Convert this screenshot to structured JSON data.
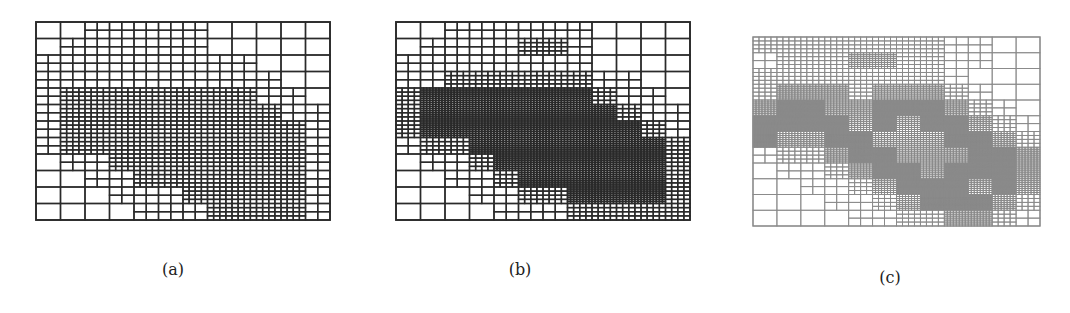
{
  "figure": {
    "type": "adaptive-mesh-refinement",
    "panels": [
      {
        "id": "a",
        "caption": "(a)",
        "stroke": "#2a2a2a",
        "coarse_cols": 12,
        "coarse_rows": 12,
        "levels": [
          [
            0,
            0,
            1,
            1,
            1,
            1,
            1,
            0,
            0,
            0,
            0,
            0
          ],
          [
            0,
            1,
            1,
            1,
            1,
            1,
            1,
            0,
            0,
            0,
            0,
            0
          ],
          [
            1,
            1,
            1,
            1,
            1,
            1,
            1,
            1,
            1,
            0,
            0,
            0
          ],
          [
            1,
            1,
            1,
            1,
            1,
            1,
            1,
            1,
            1,
            1,
            0,
            0
          ],
          [
            1,
            2,
            2,
            2,
            2,
            2,
            2,
            2,
            2,
            1,
            1,
            0
          ],
          [
            1,
            2,
            2,
            2,
            2,
            2,
            2,
            2,
            2,
            2,
            1,
            1
          ],
          [
            1,
            2,
            2,
            2,
            2,
            2,
            2,
            2,
            2,
            2,
            2,
            1
          ],
          [
            1,
            2,
            2,
            2,
            2,
            2,
            2,
            2,
            2,
            2,
            2,
            1
          ],
          [
            0,
            1,
            1,
            2,
            2,
            2,
            2,
            2,
            2,
            2,
            2,
            1
          ],
          [
            0,
            0,
            1,
            1,
            2,
            2,
            2,
            2,
            2,
            2,
            2,
            1
          ],
          [
            0,
            0,
            0,
            1,
            1,
            1,
            2,
            2,
            2,
            2,
            2,
            1
          ],
          [
            0,
            0,
            0,
            0,
            1,
            1,
            1,
            2,
            2,
            2,
            2,
            1
          ]
        ]
      },
      {
        "id": "b",
        "caption": "(b)",
        "stroke": "#2a2a2a",
        "coarse_cols": 12,
        "coarse_rows": 12,
        "levels": [
          [
            0,
            0,
            1,
            1,
            1,
            1,
            1,
            1,
            0,
            0,
            0,
            0
          ],
          [
            0,
            1,
            1,
            1,
            1,
            2,
            2,
            1,
            0,
            0,
            0,
            0
          ],
          [
            1,
            1,
            1,
            1,
            1,
            1,
            1,
            1,
            0,
            0,
            0,
            0
          ],
          [
            1,
            1,
            2,
            2,
            2,
            2,
            2,
            2,
            1,
            1,
            0,
            0
          ],
          [
            2,
            3,
            3,
            3,
            3,
            3,
            3,
            3,
            2,
            1,
            1,
            0
          ],
          [
            2,
            3,
            3,
            3,
            3,
            3,
            3,
            3,
            3,
            2,
            1,
            1
          ],
          [
            2,
            3,
            3,
            3,
            3,
            3,
            3,
            3,
            3,
            3,
            2,
            1
          ],
          [
            1,
            2,
            2,
            3,
            3,
            3,
            3,
            3,
            3,
            3,
            3,
            2
          ],
          [
            0,
            1,
            1,
            2,
            3,
            3,
            3,
            3,
            3,
            3,
            3,
            2
          ],
          [
            0,
            0,
            1,
            1,
            2,
            3,
            3,
            3,
            3,
            3,
            3,
            2
          ],
          [
            0,
            0,
            0,
            1,
            1,
            2,
            2,
            3,
            3,
            3,
            3,
            2
          ],
          [
            0,
            0,
            0,
            0,
            1,
            1,
            1,
            2,
            2,
            2,
            2,
            2
          ]
        ]
      },
      {
        "id": "c",
        "caption": "(c)",
        "stroke": "#8a8a8a",
        "coarse_cols": 12,
        "coarse_rows": 12,
        "levels": [
          [
            2,
            2,
            2,
            2,
            2,
            2,
            2,
            2,
            1,
            1,
            0,
            0
          ],
          [
            1,
            2,
            2,
            2,
            3,
            3,
            2,
            2,
            1,
            1,
            0,
            0
          ],
          [
            2,
            2,
            2,
            2,
            2,
            2,
            2,
            2,
            1,
            0,
            0,
            0
          ],
          [
            2,
            3,
            3,
            3,
            2,
            3,
            3,
            3,
            2,
            1,
            0,
            0
          ],
          [
            3,
            4,
            4,
            3,
            3,
            4,
            4,
            4,
            3,
            2,
            1,
            0
          ],
          [
            4,
            4,
            4,
            4,
            3,
            4,
            3,
            4,
            4,
            3,
            2,
            1
          ],
          [
            4,
            3,
            3,
            4,
            4,
            3,
            3,
            3,
            4,
            4,
            3,
            2
          ],
          [
            1,
            2,
            2,
            3,
            4,
            4,
            3,
            3,
            3,
            4,
            4,
            3
          ],
          [
            0,
            1,
            1,
            2,
            3,
            4,
            4,
            3,
            4,
            4,
            4,
            3
          ],
          [
            0,
            0,
            1,
            1,
            2,
            3,
            4,
            4,
            4,
            3,
            4,
            3
          ],
          [
            0,
            0,
            0,
            1,
            1,
            2,
            3,
            4,
            4,
            4,
            3,
            2
          ],
          [
            0,
            0,
            0,
            0,
            1,
            1,
            2,
            2,
            3,
            3,
            2,
            1
          ]
        ]
      }
    ]
  }
}
